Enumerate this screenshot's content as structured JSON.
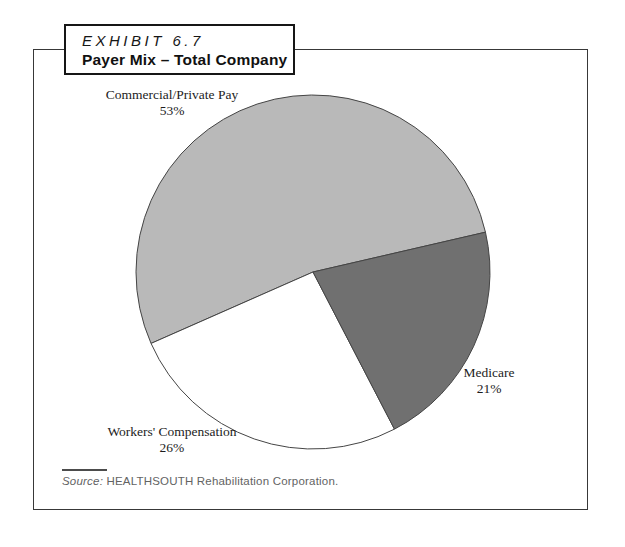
{
  "exhibit": {
    "label": "EXHIBIT 6.7",
    "title": "Payer Mix – Total Company"
  },
  "source": {
    "prefix": "Source:",
    "text": "HEALTHSOUTH Rehabilitation Corporation."
  },
  "chart_data": {
    "type": "pie",
    "title": "Payer Mix – Total Company",
    "legend_position": "none (direct slice labels)",
    "start_angle_deg": 13,
    "direction": "ccw",
    "outline_color": "#454545",
    "slices": [
      {
        "label": "Commercial/Private Pay",
        "value": 53,
        "pct_label": "53%",
        "color": "#b9b9b9"
      },
      {
        "label": "Workers' Compensation",
        "value": 26,
        "pct_label": "26%",
        "color": "#ffffff"
      },
      {
        "label": "Medicare",
        "value": 21,
        "pct_label": "21%",
        "color": "#707070"
      }
    ]
  }
}
